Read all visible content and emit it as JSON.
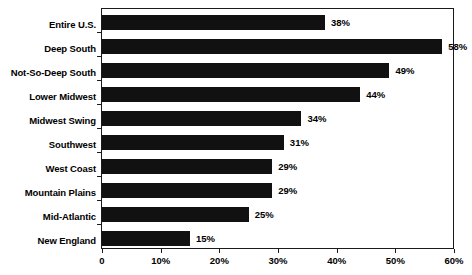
{
  "chart_data": {
    "type": "bar",
    "orientation": "horizontal",
    "title": "",
    "xlabel": "",
    "ylabel": "",
    "xlim": [
      0,
      60
    ],
    "grid": false,
    "legend": false,
    "categories": [
      "Entire U.S.",
      "Deep South",
      "Not-So-Deep South",
      "Lower Midwest",
      "Midwest Swing",
      "Southwest",
      "West Coast",
      "Mountain Plains",
      "Mid-Atlantic",
      "New England"
    ],
    "values": [
      38,
      58,
      49,
      44,
      34,
      31,
      29,
      29,
      25,
      15
    ],
    "value_labels": [
      "38%",
      "58%",
      "49%",
      "44%",
      "34%",
      "31%",
      "29%",
      "29%",
      "25%",
      "15%"
    ],
    "xticks": [
      0,
      10,
      20,
      30,
      40,
      50,
      60
    ],
    "xtick_labels": [
      "0",
      "10%",
      "20%",
      "30%",
      "40%",
      "50%",
      "60%"
    ],
    "bar_color": "#111111",
    "axis_color": "#1a1a1a",
    "background_color": "#ffffff"
  }
}
